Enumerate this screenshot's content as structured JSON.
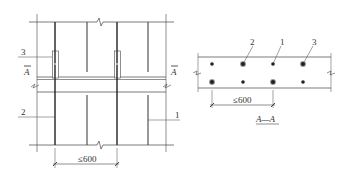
{
  "plan_view": {
    "labels": {
      "item_1": "1",
      "item_2": "2",
      "item_3": "3",
      "section_mark_left": "A",
      "section_mark_right": "A"
    },
    "dimension": "≤600"
  },
  "section_view": {
    "labels": {
      "item_1": "1",
      "item_2": "2",
      "item_3": "3"
    },
    "dimension": "≤600",
    "title": "A—A"
  },
  "colors": {
    "line": "#333333",
    "thin_line": "#555555",
    "plate_fill": "#ffffff"
  }
}
